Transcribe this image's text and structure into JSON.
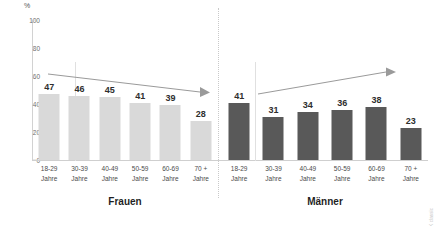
{
  "chart_data": {
    "type": "bar",
    "title": "",
    "xlabel": "",
    "ylabel": "%",
    "ylim": [
      0,
      100
    ],
    "yticks": [
      0,
      20,
      40,
      60,
      80,
      100
    ],
    "grid": false,
    "legend": "none",
    "categories": [
      "18-29 Jahre",
      "30-39 Jahre",
      "40-49 Jahre",
      "50-59 Jahre",
      "60-69 Jahre",
      "70 + Jahre"
    ],
    "series": [
      {
        "name": "Frauen",
        "values": [
          47,
          46,
          45,
          41,
          39,
          28
        ],
        "color": "#d9d9d9"
      },
      {
        "name": "Männer",
        "values": [
          41,
          31,
          34,
          36,
          38,
          23
        ],
        "color": "#595959"
      }
    ],
    "annotations": [
      {
        "name": "trend-arrow-frauen",
        "direction": "slight-decrease",
        "panel": "Frauen"
      },
      {
        "name": "trend-arrow-maenner",
        "direction": "increase",
        "panel": "Männer"
      }
    ]
  },
  "axis": {
    "unit": "%",
    "ticks": [
      "100",
      "80",
      "60",
      "40",
      "20",
      "0"
    ]
  },
  "panels": [
    {
      "id": "frauen",
      "title": "Frauen",
      "bar_color": "#d9d9d9",
      "bars": [
        {
          "value": "47",
          "line1": "18-29",
          "line2": "Jahre"
        },
        {
          "value": "46",
          "line1": "30-39",
          "line2": "Jahre"
        },
        {
          "value": "45",
          "line1": "40-49",
          "line2": "Jahre"
        },
        {
          "value": "41",
          "line1": "50-59",
          "line2": "Jahre"
        },
        {
          "value": "39",
          "line1": "60-69",
          "line2": "Jahre"
        },
        {
          "value": "28",
          "line1": "70 +",
          "line2": "Jahre"
        }
      ]
    },
    {
      "id": "maenner",
      "title": "Männer",
      "bar_color": "#595959",
      "bars": [
        {
          "value": "41",
          "line1": "18-29",
          "line2": "Jahre"
        },
        {
          "value": "31",
          "line1": "30-39",
          "line2": "Jahre"
        },
        {
          "value": "34",
          "line1": "40-49",
          "line2": "Jahre"
        },
        {
          "value": "36",
          "line1": "50-59",
          "line2": "Jahre"
        },
        {
          "value": "38",
          "line1": "60-69",
          "line2": "Jahre"
        },
        {
          "value": "23",
          "line1": "70 +",
          "line2": "Jahre"
        }
      ]
    }
  ],
  "credit": "© IKK classic"
}
